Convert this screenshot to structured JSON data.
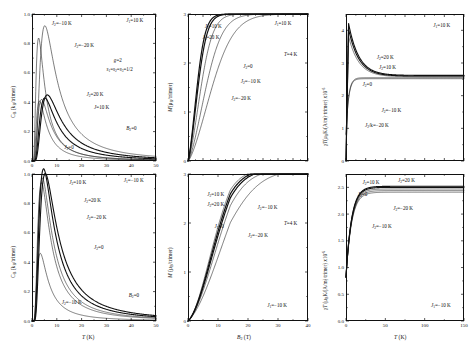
{
  "figure": {
    "type": "scientific-multi-panel-figure",
    "rows": 2,
    "cols": 3,
    "line_color": "#111111"
  },
  "chart_data": [
    {
      "id": "panel-top-left",
      "type": "line",
      "title": "",
      "xlabel": "T (K)",
      "ylabel": "C_B (k_B/trimer)",
      "ylabel_html": "C<sub>B</sub> (k<sub>B</sub>/trimer)",
      "xlim": [
        0,
        50
      ],
      "ylim": [
        0,
        1.0
      ],
      "xticks": [
        0,
        10,
        20,
        30,
        40,
        50
      ],
      "xticklabels": [
        "0",
        "10",
        "20",
        "30",
        "40",
        "50"
      ],
      "yticks": [
        0.0,
        0.2,
        0.4,
        0.6,
        0.8,
        1.0
      ],
      "yticklabels": [
        "0.0",
        "0.2",
        "0.4",
        "0.6",
        "0.8",
        "1.0"
      ],
      "grid": false,
      "legend": "inline-annotations",
      "annotations": [
        {
          "text": "J₂=-10 K",
          "x": 0.16,
          "y": 0.95
        },
        {
          "text": "J₂=-20 K",
          "x": 0.34,
          "y": 0.8
        },
        {
          "text": "J₂=20 K",
          "x": 0.44,
          "y": 0.47
        },
        {
          "text": "J=10 K",
          "x": 0.5,
          "y": 0.38
        },
        {
          "text": "J₂=0",
          "x": 0.26,
          "y": 0.11
        },
        {
          "text": "J₁=10 K",
          "x": 0.76,
          "y": 0.97
        },
        {
          "text": "g=2",
          "x": 0.66,
          "y": 0.7
        },
        {
          "text": "s₁=s₂=s₃=1/2",
          "x": 0.6,
          "y": 0.64
        },
        {
          "text": "B₂=0",
          "x": 0.76,
          "y": 0.24
        }
      ],
      "series": [
        {
          "name": "J2=-10K",
          "peak_x": 3.2,
          "peak_y": 0.8,
          "width": 2.6,
          "weight": 0.55
        },
        {
          "name": "J2=-20K",
          "peak_x": 6.2,
          "peak_y": 0.88,
          "width": 4.2,
          "weight": 0.55
        },
        {
          "name": "J2=20K",
          "peak_x": 7.4,
          "peak_y": 0.43,
          "width": 7.5,
          "weight": 1.1
        },
        {
          "name": "J=10K",
          "peak_x": 6.2,
          "peak_y": 0.41,
          "width": 6.6,
          "weight": 1.1
        },
        {
          "name": "J2=0",
          "peak_x": 4.6,
          "peak_y": 0.4,
          "width": 5.6,
          "weight": 0.55
        },
        {
          "name": "J2=extra",
          "peak_x": 3.6,
          "peak_y": 0.39,
          "width": 4.8,
          "weight": 0.55
        }
      ]
    },
    {
      "id": "panel-bottom-left",
      "type": "line",
      "xlabel": "T (K)",
      "ylabel": "C_B (k_B/trimer)",
      "ylabel_html": "C<sub>B</sub> (k<sub>B</sub>/trimer)",
      "xlim": [
        0,
        50
      ],
      "ylim": [
        0,
        1.0
      ],
      "xticks": [
        0,
        10,
        20,
        30,
        40,
        50
      ],
      "xticklabels": [
        "0",
        "10",
        "20",
        "30",
        "40",
        "50"
      ],
      "yticks": [
        0.0,
        0.2,
        0.4,
        0.6,
        0.8,
        1.0
      ],
      "yticklabels": [
        "0.0",
        "0.2",
        "0.4",
        "0.6",
        "0.8",
        "1.0"
      ],
      "grid": false,
      "annotations": [
        {
          "text": "J₂=10 K",
          "x": 0.3,
          "y": 0.96
        },
        {
          "text": "J₂=20 K",
          "x": 0.42,
          "y": 0.84
        },
        {
          "text": "J₂=-20 K",
          "x": 0.44,
          "y": 0.72
        },
        {
          "text": "J₂=0",
          "x": 0.5,
          "y": 0.52
        },
        {
          "text": "J₂=-10 K",
          "x": 0.24,
          "y": 0.14
        },
        {
          "text": "J₁=-10 K",
          "x": 0.74,
          "y": 0.97
        },
        {
          "text": "B₂=0",
          "x": 0.78,
          "y": 0.19
        }
      ],
      "series": [
        {
          "name": "J2=10K",
          "peak_x": 5.6,
          "peak_y": 0.99,
          "width": 5.4,
          "weight": 1.1
        },
        {
          "name": "J2=20K",
          "peak_x": 6.4,
          "peak_y": 0.96,
          "width": 6.2,
          "weight": 1.1
        },
        {
          "name": "J2=-20K",
          "peak_x": 5.0,
          "peak_y": 0.93,
          "width": 4.8,
          "weight": 0.55
        },
        {
          "name": "J2=0",
          "peak_x": 4.6,
          "peak_y": 0.9,
          "width": 4.4,
          "weight": 0.55
        },
        {
          "name": "J2=-10K",
          "peak_x": 4.0,
          "peak_y": 0.44,
          "width": 3.8,
          "weight": 0.55
        }
      ]
    },
    {
      "id": "panel-top-middle",
      "type": "line",
      "xlabel": "",
      "ylabel": "M (μ_B/trimer)",
      "ylabel_html": "M(μ<sub>B</sub>/trimer)",
      "xlim": [
        0,
        40
      ],
      "ylim": [
        0,
        3
      ],
      "xticks": [
        0,
        5,
        10,
        15,
        20,
        25,
        30,
        35,
        40
      ],
      "xticklabels": [
        "",
        "",
        "",
        "",
        "",
        "",
        "",
        "",
        ""
      ],
      "yticks": [
        0,
        1,
        2,
        3
      ],
      "yticklabels": [
        "0",
        "1",
        "2",
        "3"
      ],
      "grid": false,
      "annotations": [
        {
          "text": "J₂=10 K",
          "x": 0.14,
          "y": 0.93
        },
        {
          "text": "J₂=20 K",
          "x": 0.12,
          "y": 0.86
        },
        {
          "text": "J₂=0",
          "x": 0.46,
          "y": 0.66
        },
        {
          "text": "J₂=-10 K",
          "x": 0.44,
          "y": 0.56
        },
        {
          "text": "J₂=-20 K",
          "x": 0.36,
          "y": 0.44
        },
        {
          "text": "J₁=10 K",
          "x": 0.72,
          "y": 0.95
        },
        {
          "text": "T=4 K",
          "x": 0.8,
          "y": 0.74
        }
      ],
      "series": [
        {
          "name": "J2=10K",
          "sat_x": 9.0,
          "weight": 1.2
        },
        {
          "name": "J2=20K",
          "sat_x": 10.0,
          "weight": 1.2
        },
        {
          "name": "J2=0",
          "sat_x": 13.0,
          "weight": 0.55
        },
        {
          "name": "J2=-10K",
          "sat_x": 18.0,
          "weight": 0.55
        },
        {
          "name": "J2=-20K",
          "sat_x": 24.0,
          "weight": 0.55
        }
      ]
    },
    {
      "id": "panel-bottom-middle",
      "type": "line",
      "xlabel": "B₂ (T)",
      "ylabel": "M (μ_B/trimer)",
      "ylabel_html": "M (μ<sub>B</sub>/trimer)",
      "xlim": [
        0,
        40
      ],
      "ylim": [
        0,
        3
      ],
      "xticks": [
        0,
        10,
        20,
        30,
        40
      ],
      "xticklabels": [
        "0",
        "10",
        "20",
        "30",
        "40"
      ],
      "yticks": [
        0,
        1,
        2,
        3
      ],
      "yticklabels": [
        "0",
        "1",
        "2",
        "3"
      ],
      "grid": false,
      "annotations": [
        {
          "text": "J₂=10 K",
          "x": 0.16,
          "y": 0.88
        },
        {
          "text": "J₂=20 K",
          "x": 0.16,
          "y": 0.81
        },
        {
          "text": "J₂=0",
          "x": 0.22,
          "y": 0.66
        },
        {
          "text": "J₂=-10 K",
          "x": 0.58,
          "y": 0.79
        },
        {
          "text": "J₂=-20 K",
          "x": 0.5,
          "y": 0.6
        },
        {
          "text": "T=4 K",
          "x": 0.8,
          "y": 0.68
        },
        {
          "text": "J₁=-10 K",
          "x": 0.66,
          "y": 0.12
        }
      ],
      "series": [
        {
          "name": "J2=10K",
          "sat_x": 18.0,
          "weight": 1.2
        },
        {
          "name": "J2=20K",
          "sat_x": 19.0,
          "weight": 1.2
        },
        {
          "name": "J2=0",
          "sat_x": 17.0,
          "weight": 0.55
        },
        {
          "name": "J2=-10K",
          "sat_x": 21.0,
          "weight": 0.55
        },
        {
          "name": "J2=-20K",
          "sat_x": 26.0,
          "weight": 0.55
        }
      ]
    },
    {
      "id": "panel-top-right",
      "type": "line",
      "xlabel": "",
      "ylabel": "χT (μ_B K/(A/m)·trimer) x10^-6",
      "ylabel_html": "χT(μ<sub>B</sub>K/(A/m)·trimer) x10<sup>-6</sup>",
      "xlim": [
        0,
        150
      ],
      "ylim": [
        0,
        4.5
      ],
      "xticks": [
        0,
        25,
        50,
        75,
        100,
        125,
        150
      ],
      "xticklabels": [
        "",
        "",
        "",
        "",
        "",
        "",
        ""
      ],
      "yticks": [
        0,
        1,
        2,
        3,
        4
      ],
      "yticklabels": [
        "0",
        "1",
        "2",
        "3",
        "4"
      ],
      "grid": false,
      "annotations": [
        {
          "text": "J₂=20 K",
          "x": 0.26,
          "y": 0.72
        },
        {
          "text": "J₂=10 K",
          "x": 0.28,
          "y": 0.65
        },
        {
          "text": "J₂=0",
          "x": 0.14,
          "y": 0.54
        },
        {
          "text": "J₂=-10 K",
          "x": 0.3,
          "y": 0.36
        },
        {
          "text": "J₂/k=-20 K",
          "x": 0.16,
          "y": 0.26
        },
        {
          "text": "J₁=10 K",
          "x": 0.74,
          "y": 0.94
        }
      ],
      "series": [
        {
          "name": "J2=20K",
          "peak_y": 4.22,
          "tail_y": 2.62,
          "rise": false,
          "weight": 1.1
        },
        {
          "name": "J2=10K",
          "peak_y": 4.05,
          "tail_y": 2.6,
          "rise": false,
          "weight": 1.1
        },
        {
          "name": "J2=0",
          "peak_y": 3.82,
          "tail_y": 2.58,
          "rise": false,
          "weight": 0.55
        },
        {
          "name": "J2=-10K",
          "peak_y": 2.5,
          "tail_y": 2.55,
          "rise": true,
          "weight": 0.55
        },
        {
          "name": "J2=-20K",
          "peak_y": 2.42,
          "tail_y": 2.52,
          "rise": true,
          "weight": 0.55
        }
      ]
    },
    {
      "id": "panel-bottom-right",
      "type": "line",
      "xlabel": "T (K)",
      "ylabel": "χT (μ_B K/(A/m) trimer) x10^-6",
      "ylabel_html": "χT (μ<sub>B</sub>K/(A/m) trimer) x10<sup>-6</sup>",
      "xlim": [
        0,
        150
      ],
      "ylim": [
        0,
        2.75
      ],
      "xticks": [
        0,
        50,
        100,
        150
      ],
      "xticklabels": [
        "0",
        "50",
        "100",
        "150"
      ],
      "yticks": [
        0.0,
        0.5,
        1.0,
        1.5,
        2.0,
        2.5
      ],
      "yticklabels": [
        "0.0",
        "0.5",
        "1.0",
        "1.5",
        "2.0",
        "2.5"
      ],
      "grid": false,
      "annotations": [
        {
          "text": "J₂=10 K",
          "x": 0.14,
          "y": 0.96
        },
        {
          "text": "J₂=20 K",
          "x": 0.44,
          "y": 0.97
        },
        {
          "text": "J₂=0",
          "x": 0.1,
          "y": 0.88
        },
        {
          "text": "J₂=-20 K",
          "x": 0.4,
          "y": 0.78
        },
        {
          "text": "J₂=-10 K",
          "x": 0.22,
          "y": 0.66
        },
        {
          "text": "J₁=-10 K",
          "x": 0.72,
          "y": 0.12
        }
      ],
      "series": [
        {
          "name": "J2=10K",
          "plateau": 2.52,
          "start": 0.82,
          "weight": 1.1
        },
        {
          "name": "J2=20K",
          "plateau": 2.5,
          "start": 0.82,
          "weight": 1.1
        },
        {
          "name": "J2=0",
          "plateau": 2.47,
          "start": 0.82,
          "weight": 0.55
        },
        {
          "name": "J2=-20K",
          "plateau": 2.44,
          "start": 0.82,
          "weight": 0.55
        },
        {
          "name": "J2=-10K",
          "plateau": 2.41,
          "start": 0.82,
          "weight": 0.55
        }
      ]
    }
  ]
}
